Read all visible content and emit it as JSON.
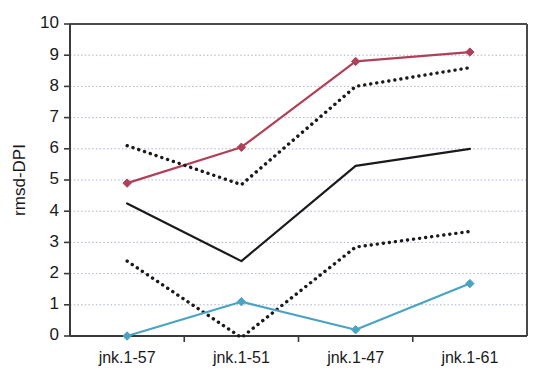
{
  "chart_data": {
    "type": "line",
    "title": "",
    "xlabel": "",
    "ylabel": "rmsd-DPI",
    "categories": [
      "jnk.1-57",
      "jnk.1-51",
      "jnk.1-47",
      "jnk.1-61"
    ],
    "ylim": [
      0,
      10
    ],
    "yticks": [
      0,
      1,
      2,
      3,
      4,
      5,
      6,
      7,
      8,
      9,
      10
    ],
    "ytick_labels": [
      "0",
      "1",
      "2",
      "3",
      "4",
      "5",
      "6",
      "7",
      "8",
      "9",
      "10"
    ],
    "grid": true,
    "legend": "none",
    "series": [
      {
        "name": "series-red",
        "style": "solid",
        "color": "#b04058",
        "marker": "diamond",
        "values": [
          4.9,
          6.05,
          8.8,
          9.1
        ]
      },
      {
        "name": "series-dotted-upper",
        "style": "dotted",
        "color": "#1a1a1a",
        "marker": "none",
        "values": [
          6.1,
          4.85,
          8.0,
          8.6
        ]
      },
      {
        "name": "series-black-solid",
        "style": "solid",
        "color": "#1a1a1a",
        "marker": "none",
        "values": [
          4.25,
          2.4,
          5.45,
          6.0
        ]
      },
      {
        "name": "series-dotted-lower",
        "style": "dotted",
        "color": "#1a1a1a",
        "marker": "none",
        "values": [
          2.4,
          -0.05,
          2.85,
          3.35
        ]
      },
      {
        "name": "series-blue",
        "style": "solid",
        "color": "#4ba3c3",
        "marker": "diamond",
        "values": [
          0.0,
          1.1,
          0.2,
          1.68
        ]
      }
    ]
  }
}
